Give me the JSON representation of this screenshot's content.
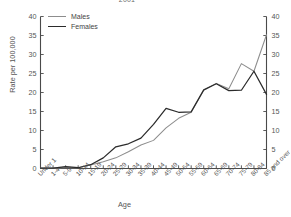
{
  "figure": {
    "partial_title": "2001",
    "ylabel": "Rate per 100,000",
    "xlabel": "Age"
  },
  "legend": {
    "position": "top-left",
    "items": [
      {
        "label": "Males",
        "color": "#8d8d8d"
      },
      {
        "label": "Females",
        "color": "#2b2b2b"
      }
    ]
  },
  "axes": {
    "y_left_ticks": [
      "0",
      "5",
      "10",
      "15",
      "20",
      "25",
      "30",
      "35",
      "40"
    ],
    "y_right_ticks": [
      "0",
      "5",
      "10",
      "15",
      "20",
      "25",
      "30",
      "35",
      "40"
    ]
  },
  "chart_data": {
    "type": "line",
    "title": "2001",
    "xlabel": "Age",
    "ylabel": "Rate per 100,000",
    "ylim": [
      0,
      40
    ],
    "ytick_step": 5,
    "grid": false,
    "legend_position": "top-left",
    "dual_y_axis": true,
    "categories": [
      "Under 1",
      "1-4",
      "5-9",
      "10-14",
      "15-19",
      "20-24",
      "25-29",
      "30-34",
      "35-39",
      "40-44",
      "45-49",
      "50-54",
      "55-59",
      "60-64",
      "65-69",
      "70-74",
      "75-79",
      "80-84",
      "85 and over"
    ],
    "series": [
      {
        "name": "Males",
        "color": "#8d8d8d",
        "values": [
          0.1,
          0.1,
          0.3,
          0.2,
          0.9,
          1.8,
          2.8,
          4.4,
          6.2,
          7.4,
          10.7,
          13.2,
          14.8,
          20.6,
          22.4,
          21.0,
          27.6,
          25.6,
          35.2
        ]
      },
      {
        "name": "Females",
        "color": "#2b2b2b",
        "values": [
          0.1,
          0.1,
          0.5,
          0.2,
          1.0,
          2.8,
          5.7,
          6.5,
          8.0,
          11.6,
          15.8,
          14.8,
          14.9,
          20.7,
          22.3,
          20.5,
          20.6,
          25.6,
          19.5
        ]
      }
    ]
  }
}
